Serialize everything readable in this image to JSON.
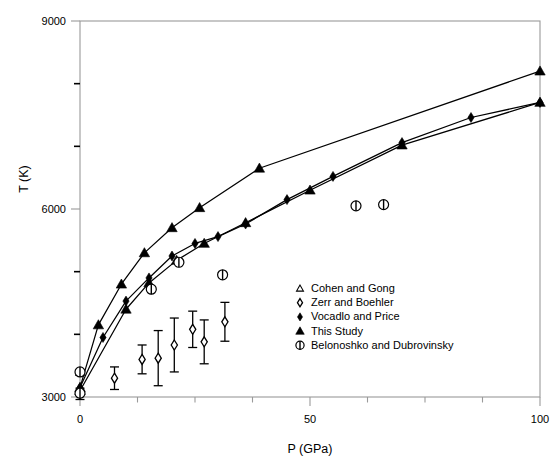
{
  "chart_data": {
    "type": "scatter",
    "title": "",
    "xlabel": "P (GPa)",
    "ylabel": "T (K)",
    "xlim": [
      0,
      100
    ],
    "ylim": [
      3000,
      9000
    ],
    "xticks": [
      0,
      50,
      100
    ],
    "xticklabels": [
      "0",
      "50",
      "100"
    ],
    "xminorticks": [
      12.5,
      25,
      37.5,
      62.5,
      75,
      87.5
    ],
    "yticks": [
      3000,
      6000,
      9000
    ],
    "yticklabels": [
      "3000",
      "6000",
      "9000"
    ],
    "yminorticks": [
      4000,
      5000,
      7000,
      8000
    ],
    "grid": false,
    "legend_position": "center-right",
    "series": [
      {
        "name": "Cohen and Gong",
        "marker": "open-triangle",
        "points": [
          {
            "x": 0,
            "y": 3400
          }
        ]
      },
      {
        "name": "Zerr and Boehler",
        "marker": "open-diamond",
        "line": false,
        "points": [
          {
            "x": 0,
            "y": 3050,
            "yerr": 90
          },
          {
            "x": 7.5,
            "y": 3300,
            "yerr": 180
          },
          {
            "x": 13.5,
            "y": 3600,
            "yerr": 230
          },
          {
            "x": 17.0,
            "y": 3620,
            "yerr": 440
          },
          {
            "x": 20.5,
            "y": 3830,
            "yerr": 430
          },
          {
            "x": 24.5,
            "y": 4080,
            "yerr": 290
          },
          {
            "x": 27.0,
            "y": 3880,
            "yerr": 350
          },
          {
            "x": 31.5,
            "y": 4200,
            "yerr": 310
          }
        ]
      },
      {
        "name": "Vocadlo and Price",
        "marker": "filled-diamond",
        "line": true,
        "points": [
          {
            "x": 0,
            "y": 3150
          },
          {
            "x": 5,
            "y": 3950
          },
          {
            "x": 10,
            "y": 4530
          },
          {
            "x": 15,
            "y": 4900
          },
          {
            "x": 20,
            "y": 5250
          },
          {
            "x": 25,
            "y": 5450
          },
          {
            "x": 30,
            "y": 5560
          },
          {
            "x": 36,
            "y": 5760
          },
          {
            "x": 45,
            "y": 6150
          },
          {
            "x": 55,
            "y": 6520
          },
          {
            "x": 70,
            "y": 7060
          },
          {
            "x": 85,
            "y": 7460
          },
          {
            "x": 100,
            "y": 7700
          }
        ]
      },
      {
        "name": "This Study",
        "marker": "filled-triangle",
        "line": true,
        "points": [
          {
            "x": 0,
            "y": 3150
          },
          {
            "x": 4,
            "y": 4150
          },
          {
            "x": 9,
            "y": 4800
          },
          {
            "x": 14,
            "y": 5300
          },
          {
            "x": 20,
            "y": 5700
          },
          {
            "x": 26,
            "y": 6020
          },
          {
            "x": 39,
            "y": 6650
          },
          {
            "x": 100,
            "y": 8200
          }
        ]
      },
      {
        "name": "This Study (lower branch)",
        "marker": "filled-triangle",
        "line": true,
        "hidden_legend": true,
        "points": [
          {
            "x": 0,
            "y": 3100
          },
          {
            "x": 10,
            "y": 4400
          },
          {
            "x": 15,
            "y": 4820
          },
          {
            "x": 21,
            "y": 5180
          },
          {
            "x": 27,
            "y": 5450
          },
          {
            "x": 36,
            "y": 5780
          },
          {
            "x": 50,
            "y": 6300
          },
          {
            "x": 70,
            "y": 7020
          },
          {
            "x": 100,
            "y": 7700
          }
        ]
      },
      {
        "name": "Belonoshko and Dubrovinsky",
        "marker": "circle-bar",
        "line": false,
        "points": [
          {
            "x": 0,
            "y": 3400
          },
          {
            "x": 0,
            "y": 3060
          },
          {
            "x": 15.5,
            "y": 4720
          },
          {
            "x": 21.5,
            "y": 5150
          },
          {
            "x": 31.0,
            "y": 4950
          },
          {
            "x": 60.0,
            "y": 6050
          },
          {
            "x": 66.0,
            "y": 6070
          }
        ]
      }
    ],
    "legend_entries": [
      {
        "marker": "open-triangle",
        "label": "Cohen and Gong"
      },
      {
        "marker": "open-diamond",
        "label": "Zerr and Boehler"
      },
      {
        "marker": "filled-diamond",
        "label": "Vocadlo and Price"
      },
      {
        "marker": "filled-triangle",
        "label": "This Study"
      },
      {
        "marker": "circle-bar",
        "label": "Belonoshko and Dubrovinsky"
      }
    ],
    "colors": {
      "axis": "#9a9a9a",
      "data": "#000000",
      "background": "#ffffff"
    }
  }
}
